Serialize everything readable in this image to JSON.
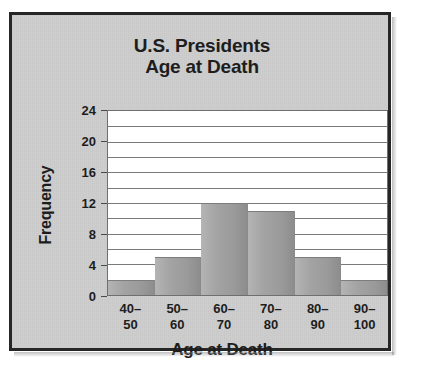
{
  "chart_data": {
    "type": "bar",
    "title": "U.S. Presidents Age at Death",
    "title_lines": [
      "U.S. Presidents",
      "Age at Death"
    ],
    "xlabel": "Age at Death",
    "ylabel": "Frequency",
    "categories": [
      "40–50",
      "50–60",
      "60–70",
      "70–80",
      "80–90",
      "90–100"
    ],
    "category_lines": [
      [
        "40–",
        "50"
      ],
      [
        "50–",
        "60"
      ],
      [
        "60–",
        "70"
      ],
      [
        "70–",
        "80"
      ],
      [
        "80–",
        "90"
      ],
      [
        "90–",
        "100"
      ]
    ],
    "values": [
      2,
      5,
      12,
      11,
      5,
      2
    ],
    "ylim": [
      0,
      24
    ],
    "ytick_labels": [
      "24",
      "20",
      "16",
      "12",
      "8",
      "4",
      "0"
    ],
    "ytick_values": [
      24,
      20,
      16,
      12,
      8,
      4,
      0
    ],
    "gridline_values": [
      2,
      4,
      6,
      8,
      10,
      12,
      14,
      16,
      18,
      20,
      22
    ],
    "grid": true,
    "legend": "none",
    "colors": {
      "background": "#cdcdcd",
      "plot_background": "#ffffff",
      "bar_fill": "#9a9a9a",
      "gridline": "#7a7a7a",
      "axis": "#6f6f6f",
      "text": "#1d1d1d",
      "frame_border": "#262626"
    }
  }
}
